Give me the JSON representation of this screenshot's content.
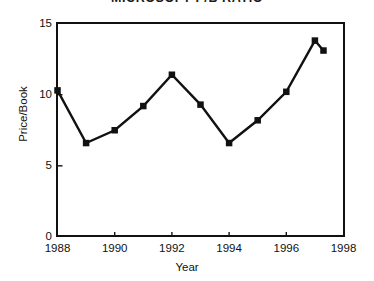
{
  "chart_data": {
    "type": "line",
    "title": "MICROSOFT P/B RATIO",
    "xlabel": "Year",
    "ylabel": "Price/Book",
    "xlim": [
      1988,
      1998
    ],
    "ylim": [
      0,
      15
    ],
    "xticks": [
      "1988",
      "1990",
      "1992",
      "1994",
      "1996",
      "1998"
    ],
    "xtick_values": [
      1988,
      1990,
      1992,
      1994,
      1996,
      1998
    ],
    "yticks": [
      "0",
      "5",
      "10",
      "15"
    ],
    "ytick_values": [
      0,
      5,
      10,
      15
    ],
    "grid": false,
    "legend": null,
    "marker": "square",
    "line_color": "#111111",
    "marker_color": "#111111",
    "x": [
      1988.0,
      1989.0,
      1990.0,
      1991.0,
      1992.0,
      1993.0,
      1994.0,
      1995.0,
      1996.0,
      1997.0,
      1997.3
    ],
    "values": [
      10.3,
      6.6,
      7.5,
      9.2,
      11.4,
      9.3,
      6.6,
      8.2,
      10.2,
      13.8,
      13.1
    ],
    "series": [
      {
        "name": "Price/Book",
        "points": [
          {
            "x": 1988.0,
            "y": 10.3
          },
          {
            "x": 1989.0,
            "y": 6.6
          },
          {
            "x": 1990.0,
            "y": 7.5
          },
          {
            "x": 1991.0,
            "y": 9.2
          },
          {
            "x": 1992.0,
            "y": 11.4
          },
          {
            "x": 1993.0,
            "y": 9.3
          },
          {
            "x": 1994.0,
            "y": 6.6
          },
          {
            "x": 1995.0,
            "y": 8.2
          },
          {
            "x": 1996.0,
            "y": 10.2
          },
          {
            "x": 1997.0,
            "y": 13.8
          },
          {
            "x": 1997.3,
            "y": 13.1
          }
        ]
      }
    ]
  }
}
